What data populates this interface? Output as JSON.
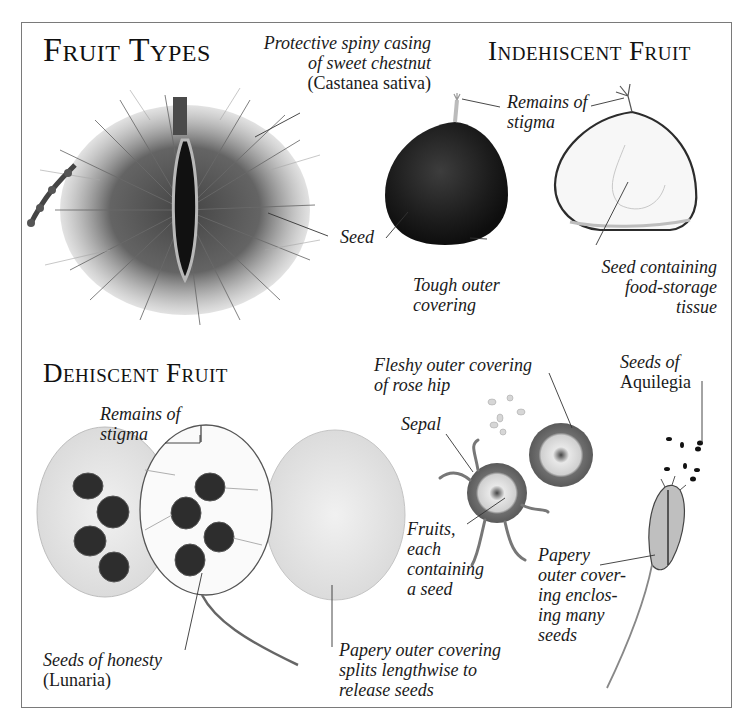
{
  "diagram": {
    "title": "Fruit Types",
    "frame_color": "#7a7a7a",
    "sections": [
      {
        "id": "indehiscent",
        "heading": "Indehiscent Fruit"
      },
      {
        "id": "dehiscent",
        "heading": "Dehiscent Fruit"
      }
    ],
    "labels": {
      "chestnut_casing": {
        "lines": [
          "Protective spiny casing",
          "of sweet chestnut"
        ],
        "scientific": "(Castanea sativa)"
      },
      "chestnut_seed": {
        "lines": [
          "Seed"
        ]
      },
      "tough_covering": {
        "lines": [
          "Tough outer",
          "covering"
        ]
      },
      "stigma_indehiscent": {
        "lines": [
          "Remains of",
          "stigma"
        ]
      },
      "seed_food_storage": {
        "lines": [
          "Seed containing",
          "food-storage",
          "tissue"
        ]
      },
      "stigma_dehiscent": {
        "lines": [
          "Remains of",
          "stigma"
        ]
      },
      "honesty_seeds": {
        "lines": [
          "Seeds of honesty"
        ],
        "scientific": "(Lunaria)"
      },
      "papery_splits": {
        "lines": [
          "Papery outer covering",
          "splits lengthwise to",
          "release seeds"
        ]
      },
      "rose_hip": {
        "lines": [
          "Fleshy outer covering",
          "of rose hip"
        ]
      },
      "sepal": {
        "lines": [
          "Sepal"
        ]
      },
      "fruits_seed": {
        "lines": [
          "Fruits,",
          "each",
          "containing",
          "a seed"
        ]
      },
      "aquilegia_seeds": {
        "lines": [
          "Seeds of"
        ],
        "scientific": "Aquilegia"
      },
      "papery_enclosing": {
        "lines": [
          "Papery",
          "outer cover-",
          "ing enclos-",
          "ing many",
          "seeds"
        ]
      }
    },
    "illustrations": [
      "sweet-chestnut-spiny-casing",
      "chestnut-whole",
      "chestnut-cross-section",
      "honesty-seed-pods",
      "rose-hip-cross-sections",
      "aquilegia-seed-pod"
    ]
  }
}
